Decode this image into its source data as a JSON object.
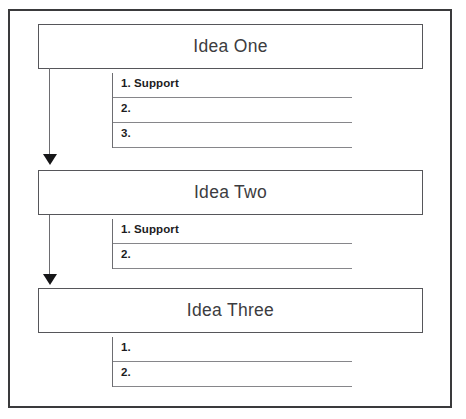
{
  "worksheet": {
    "title": "Idea and Support Outline Worksheet",
    "frame_color": "#3a3a3c",
    "box_border_color": "#56565a",
    "rule_color": "#86868a",
    "arrow_color": "#161618"
  },
  "sections": [
    {
      "idea_label": "Idea One",
      "support_rows": [
        {
          "num": "1. Support"
        },
        {
          "num": "2."
        },
        {
          "num": "3."
        }
      ]
    },
    {
      "idea_label": "Idea Two",
      "support_rows": [
        {
          "num": "1. Support"
        },
        {
          "num": "2."
        }
      ]
    },
    {
      "idea_label": "Idea Three",
      "support_rows": [
        {
          "num": "1."
        },
        {
          "num": "2."
        }
      ]
    }
  ],
  "connectors": [
    {
      "name": "idea-one-to-idea-two"
    },
    {
      "name": "idea-two-to-idea-three"
    }
  ]
}
